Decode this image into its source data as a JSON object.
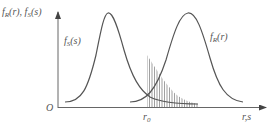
{
  "figure": {
    "y_axis_label": "f_R(r), f_S(s)",
    "x_axis_label": "r,s",
    "origin_label": "O",
    "threshold_label": "r₀",
    "curves": [
      {
        "name": "f_S(s)",
        "label": "f_S(s)",
        "peak_x": 108,
        "role": "stress density"
      },
      {
        "name": "f_R(r)",
        "label": "f_R(r)",
        "peak_x": 188,
        "role": "strength density"
      }
    ],
    "shaded_region": {
      "from": "r₀",
      "description": "hatched area under f_S(s) to the right of r₀"
    },
    "line_color": "#555555"
  }
}
